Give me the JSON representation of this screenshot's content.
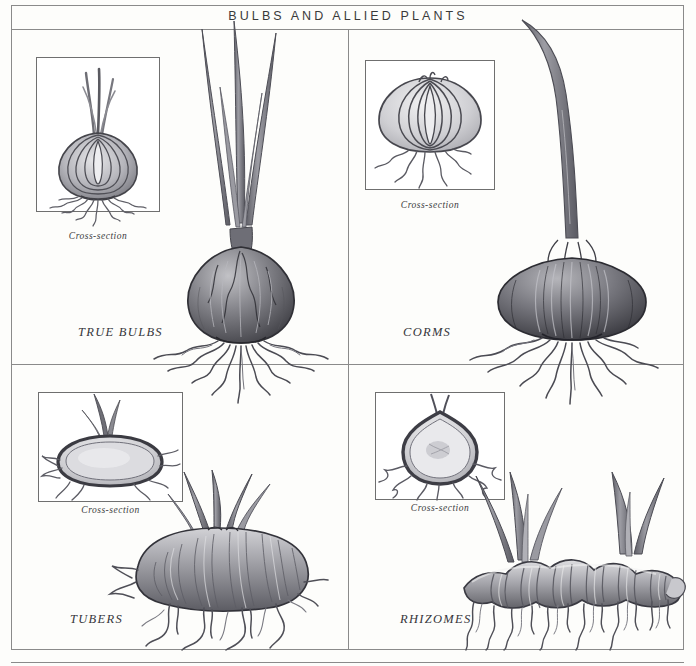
{
  "plate": {
    "title": "BULBS AND ALLIED PLANTS",
    "background_color": "#fdfdfb",
    "frame_color": "#8a8a8a"
  },
  "quadrants": [
    {
      "id": "true-bulbs",
      "label": "TRUE BULBS",
      "position": "top-left",
      "cross_section_caption": "Cross-section",
      "specimen": "onion-type bulb with concentric scale layers, papery tunic and fibrous roots"
    },
    {
      "id": "corms",
      "label": "CORMS",
      "position": "top-right",
      "cross_section_caption": "Cross-section",
      "specimen": "squat flattened corm with solid stem tissue, single shoot and fibrous roots"
    },
    {
      "id": "tubers",
      "label": "TUBERS",
      "position": "bottom-left",
      "cross_section_caption": "Cross-section",
      "specimen": "horizontal swollen tuber with eyes, multiple shoots and branching roots"
    },
    {
      "id": "rhizomes",
      "label": "RHIZOMES",
      "position": "bottom-right",
      "cross_section_caption": "Cross-section",
      "specimen": "horizontal segmented knobby rhizome with upright leaf fans and roots"
    }
  ],
  "palette": {
    "ink": "#35353a",
    "line": "#6f6f6f",
    "shade_dark": "#4a4a4e",
    "shade_mid": "#8d8d92",
    "shade_light": "#c9c9cd",
    "paper": "#ffffff"
  }
}
